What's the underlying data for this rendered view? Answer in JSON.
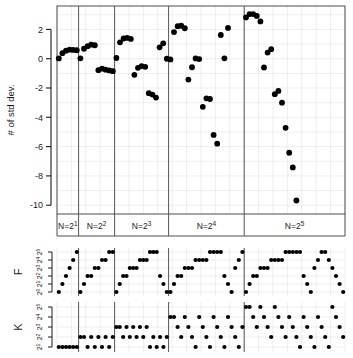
{
  "figure": {
    "background": "#ffffff",
    "point_color": "#000000",
    "panel_border_color": "#4d4d4d",
    "grid_color": "#e2e2e2",
    "separator_color": "#555555"
  },
  "chart_data": [
    {
      "id": "main",
      "type": "scatter",
      "title": "",
      "xlabel": "",
      "ylabel": "# of std dev.",
      "ylim": [
        -10.6,
        3.6
      ],
      "yticks": [
        2,
        0,
        -2,
        -4,
        -6,
        -8,
        -10
      ],
      "ytick_labels": [
        "2",
        "0",
        "-2",
        "-4",
        "-6",
        "-8",
        "-10"
      ],
      "grid": true,
      "legend": "none",
      "group_labels": [
        "N=2",
        "N=2",
        "N=2",
        "N=2",
        "N=2"
      ],
      "group_exponents": [
        "1",
        "2",
        "3",
        "4",
        "5"
      ],
      "group_boundaries": [
        0,
        6,
        16,
        31,
        52,
        80
      ],
      "x": [
        1,
        2,
        3,
        4,
        5,
        6,
        7,
        8,
        9,
        10,
        11,
        12,
        13,
        14,
        15,
        16,
        17,
        18,
        19,
        20,
        21,
        22,
        23,
        24,
        25,
        26,
        27,
        28,
        29,
        30,
        31,
        32,
        33,
        34,
        35,
        36,
        37,
        38,
        39,
        40,
        41,
        42,
        43,
        44,
        45,
        46,
        47,
        48,
        49,
        50,
        51,
        52,
        53,
        54,
        55,
        56,
        57,
        58,
        59,
        60,
        61,
        62,
        63,
        64,
        65,
        66,
        67,
        68,
        69,
        70,
        71,
        72,
        73,
        74,
        75,
        76,
        77,
        78,
        79,
        80
      ],
      "values": [
        0.02,
        0.38,
        0.55,
        0.62,
        0.6,
        0.58,
        0.03,
        0.68,
        0.86,
        0.96,
        0.92,
        -0.78,
        -0.68,
        -0.75,
        -0.8,
        -0.85,
        0.05,
        1.12,
        1.38,
        1.42,
        1.35,
        -1.1,
        -0.62,
        -0.5,
        -0.55,
        -2.35,
        -2.45,
        -2.65,
        0.78,
        1.05,
        0.0,
        -0.05,
        1.82,
        2.22,
        2.25,
        2.08,
        -1.42,
        -0.58,
        0.02,
        -0.02,
        -3.28,
        -2.7,
        -2.75,
        -5.2,
        -5.8,
        1.62,
        0.03,
        2.1,
        0.0,
        0.0,
        0.0,
        0.0,
        2.82,
        3.05,
        3.05,
        2.92,
        2.55,
        -0.6,
        0.42,
        0.65,
        -2.42,
        -2.2,
        -3.0,
        -4.72,
        -6.42,
        -7.42,
        -9.68,
        0.0,
        0.0,
        0.0,
        0.0,
        0.0,
        0.0,
        0.0,
        0.0,
        0.0,
        0.0,
        0.0,
        0.0
      ]
    },
    {
      "id": "F",
      "type": "scatter",
      "ylabel": "F",
      "ytick_labels": [
        "2",
        "2",
        "2",
        "2",
        "2",
        "2"
      ],
      "ytick_exponents": [
        "0",
        "1",
        "2",
        "3",
        "4",
        "5"
      ],
      "ylim": [
        -0.4,
        5.4
      ],
      "grid": true,
      "series_note": "staircase: each N-group rises through powers of two with increasing repeats",
      "groups": [
        {
          "values": [
            0,
            1,
            2,
            3,
            4,
            5
          ]
        },
        {
          "values": [
            0,
            1,
            2,
            2,
            3,
            3,
            4,
            4,
            5,
            5
          ]
        },
        {
          "values": [
            0,
            1,
            2,
            2,
            3,
            3,
            3,
            4,
            4,
            4,
            5,
            5,
            5,
            2,
            1,
            0
          ]
        },
        {
          "values": [
            0,
            1,
            2,
            2,
            3,
            3,
            3,
            4,
            4,
            4,
            4,
            5,
            5,
            5,
            5,
            2,
            1,
            0,
            3,
            4,
            5
          ]
        },
        {
          "values": [
            0,
            1,
            2,
            2,
            3,
            3,
            3,
            4,
            4,
            4,
            4,
            5,
            5,
            5,
            5,
            5,
            2,
            1,
            0,
            3,
            4,
            5,
            5,
            4,
            3,
            2,
            1,
            0
          ]
        }
      ]
    },
    {
      "id": "K",
      "type": "scatter",
      "ylabel": "K",
      "ytick_labels": [
        "2",
        "2",
        "2",
        "2",
        "2"
      ],
      "ytick_exponents": [
        "1",
        "2",
        "3",
        "4",
        "5"
      ],
      "ylim": [
        0.5,
        5.5
      ],
      "grid": true,
      "series_note": "sawtooth: K cycles through powers of two within each N-group",
      "groups": [
        {
          "values": [
            1,
            1,
            1,
            1,
            1,
            1
          ]
        },
        {
          "values": [
            2,
            2,
            1,
            2,
            1,
            2,
            1,
            2,
            1,
            2
          ]
        },
        {
          "values": [
            3,
            3,
            2,
            3,
            2,
            3,
            2,
            3,
            2,
            3,
            1,
            2,
            1,
            2,
            1,
            2
          ]
        },
        {
          "values": [
            4,
            4,
            3,
            2,
            4,
            3,
            2,
            1,
            4,
            3,
            2,
            1,
            4,
            3,
            2,
            1,
            4,
            3,
            2,
            1,
            3
          ]
        },
        {
          "values": [
            5,
            5,
            4,
            3,
            5,
            4,
            3,
            2,
            5,
            4,
            3,
            2,
            4,
            3,
            2,
            1,
            4,
            3,
            2,
            1,
            4,
            3,
            2,
            1,
            5,
            4,
            3,
            2
          ]
        }
      ]
    }
  ]
}
